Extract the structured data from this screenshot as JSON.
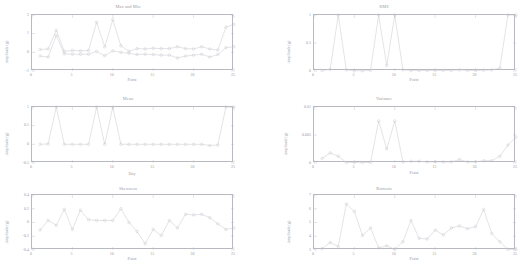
{
  "figure": {
    "caption": "",
    "panels": [
      {
        "id": "max-and-min",
        "title": "Max and Min",
        "xlabel": "Point",
        "ylabel": "Amplitude (g)"
      },
      {
        "id": "rms",
        "title": "RMS",
        "xlabel": "Point",
        "ylabel": "Amplitude (g)"
      },
      {
        "id": "mean",
        "title": "Mean",
        "xlabel": "Day",
        "ylabel": "Amplitude (g)"
      },
      {
        "id": "variance",
        "title": "Variance",
        "xlabel": "Point",
        "ylabel": "Amplitude (g)"
      },
      {
        "id": "skewness",
        "title": "Skewness",
        "xlabel": "Point",
        "ylabel": "Amplitude (g)"
      },
      {
        "id": "kurtosis",
        "title": "Kurtosis",
        "xlabel": "Point",
        "ylabel": "Amplitude (g)"
      }
    ]
  },
  "style": {
    "line_color": "#c2c2cb",
    "marker_color": "#c2c2cb",
    "axis_color": "#b9b9c2",
    "text_color": "#9a9aa4"
  },
  "chart_data": [
    {
      "type": "line",
      "title": "Max and Min",
      "xlabel": "Point",
      "ylabel": "Amplitude (g)",
      "xlim": [
        0,
        25
      ],
      "ylim": [
        -1,
        2
      ],
      "xticks": [
        0,
        5,
        10,
        15,
        20,
        25
      ],
      "yticks": [
        -1,
        0,
        1,
        2
      ],
      "grid": false,
      "legend": "none",
      "markers": "circle",
      "x": [
        1,
        2,
        3,
        4,
        5,
        6,
        7,
        8,
        9,
        10,
        11,
        12,
        13,
        14,
        15,
        16,
        17,
        18,
        19,
        20,
        21,
        22,
        23,
        24,
        25
      ],
      "series": [
        {
          "name": "Max",
          "values": [
            0.15,
            0.18,
            1.18,
            0.05,
            0.1,
            0.08,
            0.1,
            1.62,
            0.3,
            1.75,
            0.35,
            0.05,
            0.2,
            0.18,
            0.22,
            0.2,
            0.2,
            0.3,
            0.2,
            0.18,
            0.3,
            0.18,
            0.12,
            1.35,
            1.5
          ]
        },
        {
          "name": "Min",
          "values": [
            -0.2,
            -0.25,
            0.9,
            -0.08,
            -0.1,
            -0.1,
            -0.1,
            0.05,
            -0.18,
            0.08,
            0.0,
            -0.05,
            -0.12,
            -0.1,
            -0.12,
            -0.15,
            -0.15,
            -0.3,
            -0.2,
            -0.15,
            -0.1,
            -0.25,
            -0.12,
            0.25,
            0.3
          ]
        }
      ]
    },
    {
      "type": "line",
      "title": "RMS",
      "xlabel": "Point",
      "ylabel": "Amplitude (g)",
      "xlim": [
        0,
        25
      ],
      "ylim": [
        0,
        1
      ],
      "xticks": [
        0,
        5,
        10,
        15,
        20,
        25
      ],
      "yticks": [
        0,
        0.5,
        1
      ],
      "grid": false,
      "legend": "none",
      "markers": "circle",
      "x": [
        1,
        2,
        3,
        4,
        5,
        6,
        7,
        8,
        9,
        10,
        11,
        12,
        13,
        14,
        15,
        16,
        17,
        18,
        19,
        20,
        21,
        22,
        23,
        24,
        25
      ],
      "values": [
        0.01,
        0.03,
        1.0,
        0.02,
        0.005,
        0.005,
        0.01,
        1.0,
        0.1,
        1.0,
        0.02,
        0.01,
        0.01,
        0.01,
        0.01,
        0.01,
        0.01,
        0.02,
        0.01,
        0.01,
        0.015,
        0.02,
        0.05,
        1.0,
        1.0
      ]
    },
    {
      "type": "line",
      "title": "Mean",
      "xlabel": "Day",
      "ylabel": "Amplitude (g)",
      "xlim": [
        0,
        25
      ],
      "ylim": [
        -0.5,
        1
      ],
      "xticks": [
        0,
        5,
        10,
        15,
        20,
        25
      ],
      "yticks": [
        -0.5,
        0,
        0.5,
        1
      ],
      "grid": false,
      "legend": "none",
      "markers": "circle",
      "x": [
        1,
        2,
        3,
        4,
        5,
        6,
        7,
        8,
        9,
        10,
        11,
        12,
        13,
        14,
        15,
        16,
        17,
        18,
        19,
        20,
        21,
        22,
        23,
        24,
        25
      ],
      "values": [
        0.0,
        0.01,
        1.0,
        0.0,
        0.0,
        0.0,
        0.0,
        1.0,
        0.0,
        1.0,
        0.0,
        0.0,
        0.0,
        0.0,
        0.0,
        0.0,
        0.0,
        0.0,
        0.0,
        0.0,
        0.0,
        -0.03,
        -0.02,
        1.0,
        1.0
      ]
    },
    {
      "type": "line",
      "title": "Variance",
      "xlabel": "Point",
      "ylabel": "Amplitude (g)",
      "xlim": [
        0,
        25
      ],
      "ylim": [
        0,
        0.01
      ],
      "xticks": [
        0,
        5,
        10,
        15,
        20,
        25
      ],
      "yticks": [
        0,
        0.005,
        0.01
      ],
      "grid": false,
      "legend": "none",
      "markers": "circle",
      "x": [
        1,
        2,
        3,
        4,
        5,
        6,
        7,
        8,
        9,
        10,
        11,
        12,
        13,
        14,
        15,
        16,
        17,
        18,
        19,
        20,
        21,
        22,
        23,
        24,
        25
      ],
      "values": [
        0.0008,
        0.0018,
        0.0012,
        0.0001,
        0.0001,
        0.0001,
        0.0001,
        0.0075,
        0.0025,
        0.0075,
        0.0002,
        0.0003,
        0.0003,
        0.0002,
        0.0002,
        0.0002,
        0.0002,
        0.0006,
        0.0002,
        0.0002,
        0.0004,
        0.0004,
        0.0012,
        0.0032,
        0.0046
      ]
    },
    {
      "type": "line",
      "title": "Skewness",
      "xlabel": "Point",
      "ylabel": "Amplitude (g)",
      "xlim": [
        0,
        25
      ],
      "ylim": [
        -0.4,
        0.4
      ],
      "xticks": [
        0,
        5,
        10,
        15,
        20,
        25
      ],
      "yticks": [
        -0.4,
        -0.2,
        0,
        0.2,
        0.4
      ],
      "grid": false,
      "legend": "none",
      "markers": "circle",
      "x": [
        1,
        2,
        3,
        4,
        5,
        6,
        7,
        8,
        9,
        10,
        11,
        12,
        13,
        14,
        15,
        16,
        17,
        18,
        19,
        20,
        21,
        22,
        23,
        24,
        25
      ],
      "values": [
        -0.11,
        0.03,
        -0.04,
        0.19,
        -0.1,
        0.18,
        0.04,
        0.03,
        0.03,
        0.03,
        0.2,
        0.0,
        -0.13,
        -0.31,
        -0.1,
        -0.19,
        0.03,
        -0.08,
        0.12,
        0.11,
        0.12,
        0.07,
        -0.02,
        -0.1,
        -0.08
      ]
    },
    {
      "type": "line",
      "title": "Kurtosis",
      "xlabel": "Point",
      "ylabel": "Amplitude (g)",
      "xlim": [
        0,
        25
      ],
      "ylim": [
        3,
        7
      ],
      "xticks": [
        0,
        5,
        10,
        15,
        20,
        25
      ],
      "yticks": [
        3,
        4,
        5,
        6,
        7
      ],
      "grid": false,
      "legend": "none",
      "markers": "circle",
      "x": [
        1,
        2,
        3,
        4,
        5,
        6,
        7,
        8,
        9,
        10,
        11,
        12,
        13,
        14,
        15,
        16,
        17,
        18,
        19,
        20,
        21,
        22,
        23,
        24,
        25
      ],
      "values": [
        3.1,
        3.55,
        3.25,
        6.35,
        5.8,
        4.05,
        4.6,
        3.15,
        3.3,
        3.05,
        3.6,
        5.15,
        3.85,
        3.8,
        4.45,
        4.1,
        4.6,
        4.75,
        4.55,
        4.7,
        5.95,
        4.2,
        3.6,
        3.05,
        3.05
      ]
    }
  ]
}
